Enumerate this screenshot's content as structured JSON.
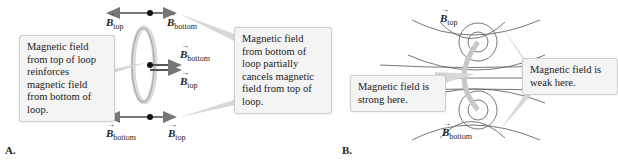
{
  "panel_a": {
    "label": "A.",
    "callout_left": "Magnetic field from top of loop reinforces magnetic field from bottom of loop.",
    "callout_right": "Magnetic field from bottom of loop partially cancels magnetic field from top of loop.",
    "vectors": {
      "top_left": {
        "symbol": "B",
        "sub": "top"
      },
      "top_right": {
        "symbol": "B",
        "sub": "bottom"
      },
      "center_upper": {
        "symbol": "B",
        "sub": "bottom"
      },
      "center_lower": {
        "symbol": "B",
        "sub": "top"
      },
      "bottom_left": {
        "symbol": "B",
        "sub": "bottom"
      },
      "bottom_right": {
        "symbol": "B",
        "sub": "top"
      }
    }
  },
  "panel_b": {
    "label": "B.",
    "callout_left": "Magnetic field is strong here.",
    "callout_right": "Magnetic field is weak here.",
    "vectors": {
      "top": {
        "symbol": "B",
        "sub": "top"
      },
      "bottom": {
        "symbol": "B",
        "sub": "bottom"
      }
    }
  },
  "colors": {
    "arrow": "#777777",
    "loop": "#b0b0b0",
    "callout_bg": "#f4f4f4",
    "field_line": "#555555"
  }
}
